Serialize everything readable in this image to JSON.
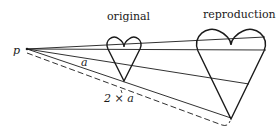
{
  "diagram": {
    "labels": {
      "point": "p",
      "original": "original",
      "reproduction": "reproduction",
      "distance_a": "a",
      "distance_2a": "2 × a"
    },
    "colors": {
      "ink": "#1a1a1a",
      "background": "#ffffff"
    },
    "elements": [
      {
        "id": "projection-point",
        "label": "p"
      },
      {
        "id": "original-heart",
        "label": "original",
        "scale": 1
      },
      {
        "id": "reproduction-heart",
        "label": "reproduction",
        "scale": 2
      },
      {
        "id": "projection-rays",
        "count": 4
      },
      {
        "id": "distance-dashed-line",
        "label": "2 × a"
      },
      {
        "id": "distance-a-marker",
        "label": "a"
      }
    ]
  }
}
